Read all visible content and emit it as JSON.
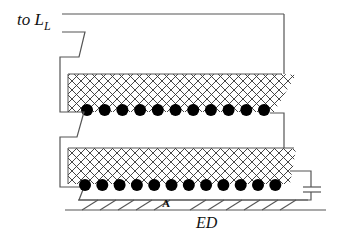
{
  "diagram": {
    "type": "cross-section schematic",
    "labels": {
      "connection": "to L",
      "connection_subscript": "L",
      "region_a": "A",
      "electrode": "ED"
    },
    "components": {
      "upper_winding": {
        "hatched_band": true,
        "conductor_count": 11
      },
      "lower_winding": {
        "hatched_band": true,
        "conductor_count": 12
      },
      "capacitor": {
        "position": "right side, between lower winding and base"
      },
      "base_strip": {
        "hatched": true
      }
    },
    "colors": {
      "line": "#555555",
      "fill_conductor": "#000000",
      "background": "#ffffff"
    }
  }
}
